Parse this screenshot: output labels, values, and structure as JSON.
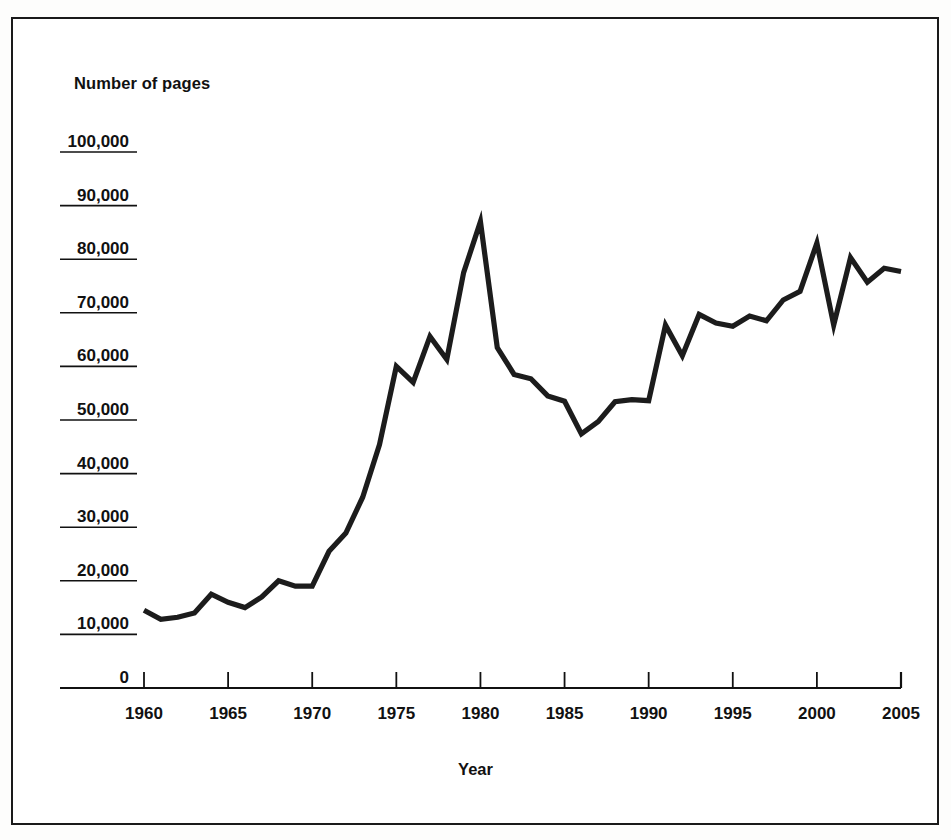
{
  "figure": {
    "y_axis_caption": "Number of pages",
    "x_axis_caption": "Year"
  },
  "chart_data": {
    "type": "line",
    "title": "",
    "subtitle": "",
    "xlabel": "Year",
    "ylabel": "Number of pages",
    "xlim": [
      1959,
      2005
    ],
    "ylim": [
      0,
      100000
    ],
    "grid": false,
    "legend": null,
    "xticks": [
      1960,
      1965,
      1970,
      1975,
      1980,
      1985,
      1990,
      1995,
      2000,
      2005
    ],
    "xtick_labels": [
      "1960",
      "1965",
      "1970",
      "1975",
      "1980",
      "1985",
      "1990",
      "1995",
      "2000",
      "2005"
    ],
    "yticks": [
      0,
      10000,
      20000,
      30000,
      40000,
      50000,
      60000,
      70000,
      80000,
      90000,
      100000
    ],
    "ytick_labels": [
      "0",
      "10,000",
      "20,000",
      "30,000",
      "40,000",
      "50,000",
      "60,000",
      "70,000",
      "80,000",
      "90,000",
      "100,000"
    ],
    "series": [
      {
        "name": "Number of pages",
        "color": "#1c1c1c",
        "x": [
          1960,
          1961,
          1962,
          1963,
          1964,
          1965,
          1966,
          1967,
          1968,
          1969,
          1970,
          1971,
          1972,
          1973,
          1974,
          1975,
          1976,
          1977,
          1978,
          1979,
          1980,
          1981,
          1982,
          1983,
          1984,
          1985,
          1986,
          1987,
          1988,
          1989,
          1990,
          1991,
          1992,
          1993,
          1994,
          1995,
          1996,
          1997,
          1998,
          1999,
          2000,
          2001,
          2002,
          2003,
          2004,
          2005
        ],
        "values": [
          14500,
          12800,
          13200,
          14000,
          17500,
          16000,
          15000,
          17000,
          20000,
          19000,
          19000,
          25500,
          28900,
          35600,
          45400,
          60000,
          57000,
          65600,
          61300,
          77500,
          87000,
          63500,
          58500,
          57700,
          54500,
          53500,
          47400,
          49700,
          53400,
          53800,
          53600,
          67700,
          62000,
          69700,
          68100,
          67500,
          69400,
          68500,
          72400,
          74000,
          83000,
          67700,
          80300,
          75700,
          78300,
          77700
        ]
      }
    ],
    "annotations": []
  }
}
